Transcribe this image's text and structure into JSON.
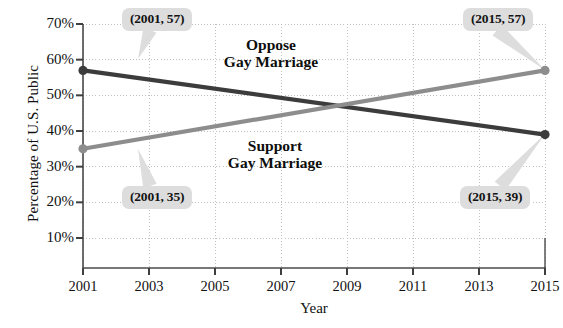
{
  "chart_data": {
    "type": "line",
    "title": "",
    "xlabel": "Year",
    "ylabel": "Percentage of U.S. Public",
    "x": [
      2001,
      2015
    ],
    "xlim": [
      2001,
      2015
    ],
    "ylim": [
      5,
      72
    ],
    "grid": true,
    "legend_position": "inline-annotations",
    "xticks": [
      "2001",
      "2003",
      "2005",
      "2007",
      "2009",
      "2011",
      "2013",
      "2015"
    ],
    "xtick_values": [
      2001,
      2003,
      2005,
      2007,
      2009,
      2011,
      2013,
      2015
    ],
    "yticks": [
      "10%",
      "20%",
      "30%",
      "40%",
      "50%",
      "60%",
      "70%"
    ],
    "ytick_values": [
      10,
      20,
      30,
      40,
      50,
      60,
      70
    ],
    "series": [
      {
        "name": "Oppose Gay Marriage",
        "color": "#3c3c3c",
        "x": [
          2001,
          2015
        ],
        "values": [
          57,
          39
        ],
        "label_lines": [
          "Oppose",
          "Gay Marriage"
        ]
      },
      {
        "name": "Support Gay Marriage",
        "color": "#8d8d8d",
        "x": [
          2001,
          2015
        ],
        "values": [
          35,
          57
        ],
        "label_lines": [
          "Support",
          "Gay Marriage"
        ]
      }
    ],
    "annotations": [
      {
        "text": "(2001, 57)",
        "series": "Oppose Gay Marriage",
        "point": [
          2001,
          57
        ]
      },
      {
        "text": "(2015, 57)",
        "series": "Support Gay Marriage",
        "point": [
          2015,
          57
        ]
      },
      {
        "text": "(2001, 35)",
        "series": "Support Gay Marriage",
        "point": [
          2001,
          35
        ]
      },
      {
        "text": "(2015, 39)",
        "series": "Oppose Gay Marriage",
        "point": [
          2015,
          39
        ]
      }
    ],
    "colors": {
      "oppose": "#3c3c3c",
      "support": "#8d8d8d",
      "callout_bg": "#dddddd",
      "axis": "#4a4a4a",
      "grid": "#b9b9b9"
    }
  }
}
